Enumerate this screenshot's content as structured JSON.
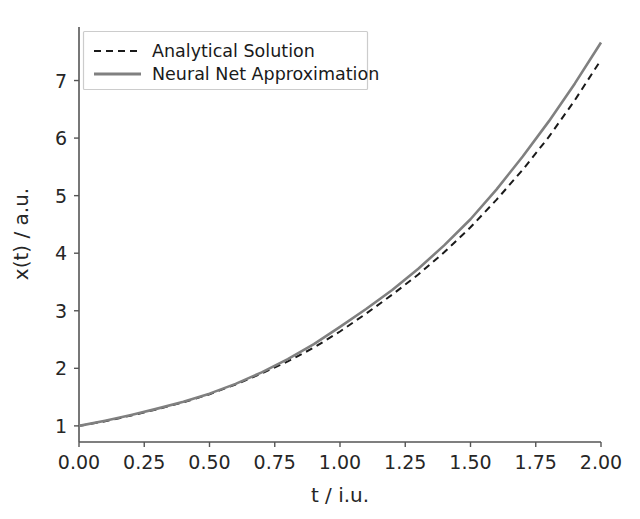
{
  "chart_data": {
    "type": "line",
    "title": "",
    "xlabel": "t / i.u.",
    "ylabel": "x(t) / a.u.",
    "xlim": [
      0.0,
      2.0
    ],
    "ylim": [
      0.72,
      7.93
    ],
    "grid": false,
    "legend_position": "upper left",
    "xticks": [
      "0.00",
      "0.25",
      "0.50",
      "0.75",
      "1.00",
      "1.25",
      "1.50",
      "1.75",
      "2.00"
    ],
    "xtick_values": [
      0.0,
      0.25,
      0.5,
      0.75,
      1.0,
      1.25,
      1.5,
      1.75,
      2.0
    ],
    "yticks": [
      "1",
      "2",
      "3",
      "4",
      "5",
      "6",
      "7"
    ],
    "ytick_values": [
      1,
      2,
      3,
      4,
      5,
      6,
      7
    ],
    "x": [
      0.0,
      0.1,
      0.2,
      0.3,
      0.4,
      0.5,
      0.6,
      0.7,
      0.8,
      0.9,
      1.0,
      1.1,
      1.2,
      1.3,
      1.4,
      1.5,
      1.6,
      1.7,
      1.8,
      1.9,
      2.0
    ],
    "series": [
      {
        "name": "Analytical Solution",
        "linestyle": "dashed",
        "color": "#1a1a1a",
        "linewidth": 2.0,
        "values": [
          1.0,
          1.08,
          1.18,
          1.29,
          1.41,
          1.55,
          1.72,
          1.91,
          2.12,
          2.36,
          2.64,
          2.95,
          3.28,
          3.63,
          4.02,
          4.45,
          4.93,
          5.45,
          6.02,
          6.66,
          7.36
        ]
      },
      {
        "name": "Neural Net Approximation",
        "linestyle": "solid",
        "color": "#808080",
        "linewidth": 2.6,
        "values": [
          1.0,
          1.09,
          1.19,
          1.3,
          1.42,
          1.56,
          1.73,
          1.93,
          2.16,
          2.42,
          2.72,
          3.03,
          3.36,
          3.73,
          4.14,
          4.59,
          5.11,
          5.68,
          6.29,
          6.95,
          7.66
        ]
      }
    ]
  },
  "legend": {
    "items": [
      {
        "label": "Analytical Solution",
        "style": "dashed",
        "color": "#1a1a1a"
      },
      {
        "label": "Neural Net Approximation",
        "style": "solid",
        "color": "#808080"
      }
    ]
  }
}
